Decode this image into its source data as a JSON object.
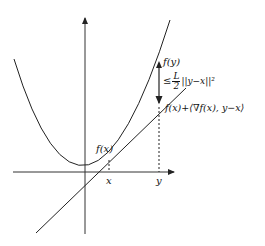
{
  "diagram": {
    "labels": {
      "f_y": "f(y)",
      "leq": "≤",
      "frac_num": "L",
      "frac_den": "2",
      "norm": "||y−x||²",
      "linear_bound": "f(x)+⟨∇f(x), y−x⟩",
      "f_x": "f(x)",
      "x_tick": "x",
      "y_tick": "y"
    },
    "colors": {
      "stroke": "#222222",
      "axis": "#333333"
    }
  }
}
